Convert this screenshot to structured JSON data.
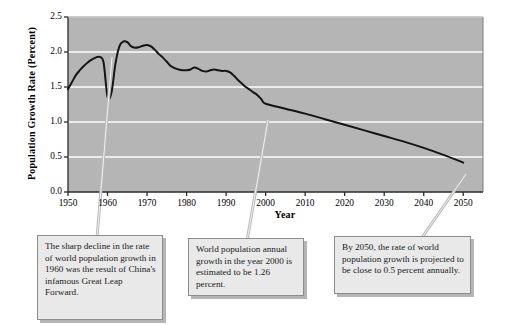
{
  "chart_data": {
    "type": "line",
    "title": "",
    "xlabel": "Year",
    "ylabel": "Population Growth Rate (Percent)",
    "xlim": [
      1950,
      2055
    ],
    "ylim": [
      0.0,
      2.5
    ],
    "grid": true,
    "legend": "none",
    "xticks": [
      1950,
      1960,
      1970,
      1980,
      1990,
      2000,
      2010,
      2020,
      2030,
      2040,
      2050
    ],
    "xtick_labels": [
      "1950",
      "1960",
      "1970",
      "1980",
      "1990",
      "2000",
      "2010",
      "2020",
      "2030",
      "2040",
      "2050"
    ],
    "yticks": [
      0.0,
      0.5,
      1.0,
      1.5,
      2.0,
      2.5
    ],
    "ytick_labels": [
      "0.0",
      "0.5",
      "1.0",
      "1.5",
      "2.0",
      "2.5"
    ],
    "series": [
      {
        "name": "World population growth rate",
        "color": "#141414",
        "x": [
          1950,
          1951,
          1952,
          1953,
          1954,
          1955,
          1956,
          1957,
          1958,
          1959,
          1960,
          1961,
          1962,
          1963,
          1964,
          1965,
          1966,
          1967,
          1968,
          1969,
          1970,
          1971,
          1972,
          1973,
          1974,
          1975,
          1976,
          1977,
          1978,
          1979,
          1980,
          1981,
          1982,
          1983,
          1984,
          1985,
          1986,
          1987,
          1988,
          1989,
          1990,
          1991,
          1992,
          1993,
          1994,
          1995,
          1996,
          1997,
          1998,
          1999,
          2000,
          2005,
          2010,
          2015,
          2020,
          2025,
          2030,
          2035,
          2040,
          2045,
          2050
        ],
        "y": [
          1.47,
          1.57,
          1.67,
          1.74,
          1.8,
          1.85,
          1.89,
          1.92,
          1.93,
          1.85,
          1.36,
          1.42,
          1.83,
          2.08,
          2.15,
          2.14,
          2.08,
          2.06,
          2.07,
          2.09,
          2.1,
          2.08,
          2.03,
          1.97,
          1.92,
          1.86,
          1.8,
          1.77,
          1.75,
          1.74,
          1.74,
          1.75,
          1.78,
          1.76,
          1.73,
          1.72,
          1.74,
          1.75,
          1.74,
          1.73,
          1.73,
          1.71,
          1.66,
          1.6,
          1.55,
          1.5,
          1.46,
          1.42,
          1.38,
          1.32,
          1.26,
          1.19,
          1.12,
          1.04,
          0.96,
          0.88,
          0.8,
          0.72,
          0.63,
          0.53,
          0.42
        ]
      }
    ],
    "annotations": [
      {
        "id": "great-leap-forward",
        "text": "The sharp decline in the rate of world population growth in 1960 was the result of China's infamous Great Leap Forward.",
        "points_to_year": 1960,
        "points_to_value": 1.36
      },
      {
        "id": "year-2000-growth",
        "text": "World population annual growth in the year 2000 is estimated to be 1.26 percent.",
        "points_to_year": 2000,
        "points_to_value": 1.26
      },
      {
        "id": "year-2050-projection",
        "text": "By 2050, the rate of world population growth is projected to be close to 0.5 percent annually.",
        "points_to_year": 2050,
        "points_to_value": 0.42
      }
    ],
    "colors": {
      "plot_background": "#b5b5b5",
      "gridline": "#ffffff",
      "line": "#141414",
      "axis": "#2a2a2a",
      "callout_fill": "#e9e9e9",
      "callout_border": "#8c8c8c"
    }
  }
}
